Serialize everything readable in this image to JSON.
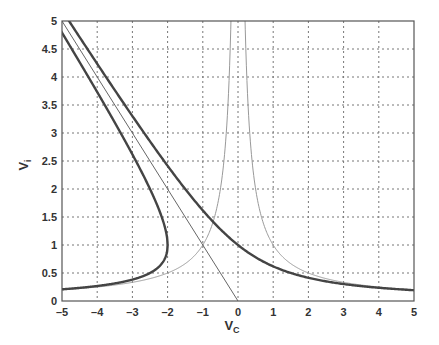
{
  "chart_data": {
    "type": "line",
    "title": "",
    "xlabel": "V",
    "xlabel_sub": "C",
    "ylabel": "V",
    "ylabel_sub": "i",
    "xlim": [
      -5,
      5
    ],
    "ylim": [
      0,
      5
    ],
    "grid": true,
    "legend": null,
    "x_ticks": [
      "-5",
      "-4",
      "-3",
      "-2",
      "-1",
      "0",
      "1",
      "2",
      "3",
      "4",
      "5"
    ],
    "y_ticks": [
      "0",
      "0.5",
      "1",
      "1.5",
      "2",
      "2.5",
      "3",
      "3.5",
      "4",
      "4.5",
      "5"
    ],
    "series": [
      {
        "name": "thick upper branch (x + sqrt(x^2+4))",
        "style": "thick dark",
        "x": [
          -5,
          -4,
          -3,
          -2,
          -1,
          0,
          1,
          2,
          3,
          4,
          5
        ],
        "values": [
          5.19,
          4.24,
          3.3,
          2.41,
          1.62,
          1.0,
          0.62,
          0.41,
          0.3,
          0.24,
          0.19
        ]
      },
      {
        "name": "thick left turning curve upper (x <= -2)",
        "style": "thick dark",
        "x": [
          -5,
          -4.5,
          -4,
          -3.5,
          -3,
          -2.5,
          -2
        ],
        "values": [
          4.79,
          4.26,
          3.73,
          3.19,
          2.62,
          2.0,
          1.0
        ]
      },
      {
        "name": "thick left turning curve lower (x <= -2)",
        "style": "thick dark",
        "x": [
          -5,
          -4.5,
          -4,
          -3.5,
          -3,
          -2.5,
          -2
        ],
        "values": [
          0.21,
          0.24,
          0.27,
          0.31,
          0.38,
          0.5,
          1.0
        ]
      },
      {
        "name": "thin diagonal line V = -Vc",
        "style": "thin",
        "x": [
          -5,
          0
        ],
        "values": [
          5,
          0
        ]
      },
      {
        "name": "thin curve V = 1/|Vc|",
        "style": "thin light",
        "x": [
          -5,
          -4,
          -3,
          -2,
          -1,
          -0.5,
          -0.2,
          0.2,
          0.5,
          1,
          2,
          3,
          4,
          5
        ],
        "values": [
          0.2,
          0.25,
          0.33,
          0.5,
          1.0,
          2.0,
          5.0,
          5.0,
          2.0,
          1.0,
          0.5,
          0.33,
          0.25,
          0.2
        ]
      }
    ]
  }
}
